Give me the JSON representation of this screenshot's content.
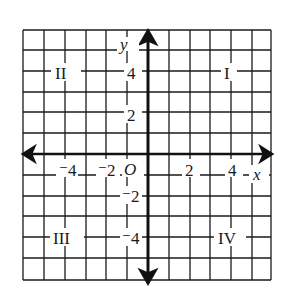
{
  "plane": {
    "x_axis_label": "x",
    "y_axis_label": "y",
    "origin_label": "O",
    "range": [
      -6,
      6
    ],
    "grid_step": 1
  },
  "x_ticks": [
    {
      "value": -4,
      "label": "⁻4"
    },
    {
      "value": -2,
      "label": "⁻2"
    },
    {
      "value": 2,
      "label": "2"
    },
    {
      "value": 4,
      "label": "4"
    }
  ],
  "y_ticks": [
    {
      "value": 4,
      "label": "4"
    },
    {
      "value": 2,
      "label": "2"
    },
    {
      "value": -2,
      "label": "⁻2"
    },
    {
      "value": -4,
      "label": "⁻4"
    }
  ],
  "quadrants": [
    {
      "id": "I",
      "label": "I"
    },
    {
      "id": "II",
      "label": "II"
    },
    {
      "id": "III",
      "label": "III"
    },
    {
      "id": "IV",
      "label": "IV"
    }
  ],
  "colors": {
    "line": "#1a1a1a",
    "background": "#ffffff"
  }
}
